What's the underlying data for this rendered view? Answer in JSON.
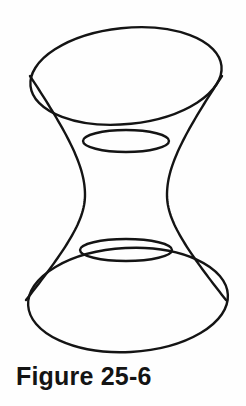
{
  "page": {
    "width": 246,
    "height": 406,
    "background_color": "#fefefe",
    "ink_color": "#141414"
  },
  "caption": {
    "text": "Figure 25-6",
    "label": "Figure",
    "number": "25-6"
  },
  "figure": {
    "name": "hyperboloid-of-one-sheet",
    "style": "line-drawing",
    "stroke_color": "#141414",
    "fill": "none",
    "outline_stroke_width": 2.4,
    "ruling_stroke_width": 1.5,
    "geometry": {
      "center_x": 126,
      "top_ellipse": {
        "cx": 126,
        "cy": 76,
        "rx": 96,
        "ry": 48,
        "rotation_deg": -6
      },
      "bottom_ellipse": {
        "cx": 128,
        "cy": 300,
        "rx": 100,
        "ry": 52,
        "rotation_deg": -3
      },
      "waist": {
        "cy": 195,
        "rx": 41,
        "ry": 13,
        "top_rim_cy": 141,
        "bottom_rim_cy": 250,
        "top_rim_rx": 43,
        "bottom_rim_rx": 46
      },
      "generator_count": 22,
      "twist_deg": 78
    }
  }
}
